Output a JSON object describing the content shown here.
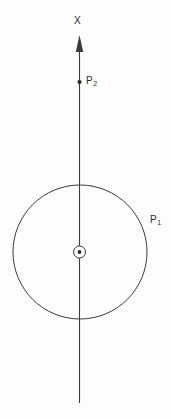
{
  "figure": {
    "background_color": "#fdfdfd",
    "stroke_color": "#3a3a3a",
    "text_color": "#2b2b2b",
    "width": 171,
    "height": 419,
    "axis": {
      "name": "vertical-axis",
      "label": "X",
      "direction": "up",
      "x": 79.5,
      "y_top": 36,
      "y_bottom": 403,
      "arrowhead": "filled-triangle"
    },
    "circle": {
      "name": "large-circle",
      "label": "P",
      "label_subscript": "1",
      "center_x": 80,
      "center_y": 252,
      "radius": 67,
      "fill": "none"
    },
    "center_marker": {
      "name": "out-of-page-vector-symbol",
      "glyph": "circle-dot",
      "center_x": 79.5,
      "center_y": 252,
      "outer_radius": 6,
      "dot_radius": 1.9
    },
    "points": [
      {
        "name": "point-p2",
        "label": "P",
        "label_subscript": "2",
        "x": 79.5,
        "y": 82,
        "marker": "filled-dot",
        "marker_radius": 2.1
      }
    ]
  }
}
